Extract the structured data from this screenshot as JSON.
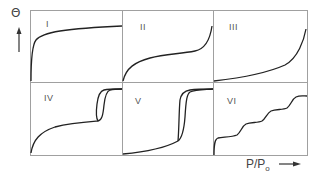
{
  "figure": {
    "y_axis_label": "Θ",
    "x_axis_label_main": "P/P",
    "x_axis_label_sub": "o",
    "panels": [
      {
        "id": "I",
        "label": "I"
      },
      {
        "id": "II",
        "label": "II"
      },
      {
        "id": "III",
        "label": "III"
      },
      {
        "id": "IV",
        "label": "IV"
      },
      {
        "id": "V",
        "label": "V"
      },
      {
        "id": "VI",
        "label": "VI"
      }
    ]
  },
  "colors": {
    "frame": "#9a9a9a",
    "curve": "#222222",
    "text": "#555555"
  }
}
